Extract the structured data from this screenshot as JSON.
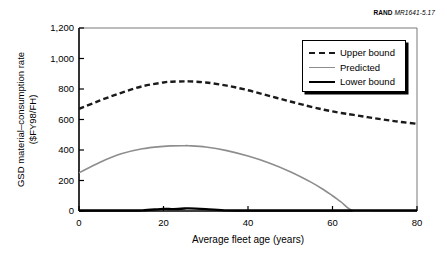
{
  "credit": {
    "org": "RAND",
    "doc_id": "MR1641-5.17"
  },
  "chart_data": {
    "type": "line",
    "title": "",
    "xlabel": "Average fleet age (years)",
    "ylabel": "GSD material–consumption rate\n($FY98/FH)",
    "xlim": [
      0,
      80
    ],
    "ylim": [
      0,
      1200
    ],
    "xticks": [
      0,
      20,
      40,
      60,
      80
    ],
    "yticks": [
      0,
      200,
      400,
      600,
      800,
      1000,
      1200
    ],
    "xtick_labels": [
      "0",
      "20",
      "40",
      "60",
      "80"
    ],
    "ytick_labels": [
      "0",
      "200",
      "400",
      "600",
      "800",
      "1,000",
      "1,200"
    ],
    "grid": false,
    "legend_position": "upper right",
    "x": [
      0,
      5,
      10,
      15,
      20,
      22,
      25,
      26,
      30,
      35,
      40,
      45,
      50,
      55,
      58,
      60,
      62,
      65,
      70,
      75,
      80
    ],
    "series": [
      {
        "name": "Upper bound",
        "style": "dashed",
        "color": "#1a1a1a",
        "width": 2.4,
        "values": [
          670,
          725,
          775,
          818,
          843,
          848,
          850,
          850,
          843,
          822,
          792,
          755,
          718,
          683,
          664,
          653,
          643,
          630,
          608,
          588,
          572
        ]
      },
      {
        "name": "Predicted",
        "style": "solid",
        "color": "#8d8d8d",
        "width": 1.6,
        "values": [
          250,
          320,
          375,
          408,
          424,
          427,
          428,
          428,
          420,
          396,
          360,
          315,
          258,
          188,
          138,
          100,
          60,
          0,
          0,
          0,
          0
        ]
      },
      {
        "name": "Lower bound",
        "style": "solid",
        "color": "#000000",
        "width": 2.4,
        "values": [
          3,
          3,
          3,
          4,
          14,
          12,
          16,
          17,
          12,
          4,
          3,
          3,
          3,
          3,
          3,
          3,
          3,
          3,
          3,
          3,
          3
        ]
      }
    ]
  },
  "legend": {
    "items": [
      {
        "label": "Upper bound",
        "sample": "dashed-line-sample"
      },
      {
        "label": "Predicted",
        "sample": "gray-line-sample"
      },
      {
        "label": "Lower bound",
        "sample": "black-line-sample"
      }
    ]
  }
}
